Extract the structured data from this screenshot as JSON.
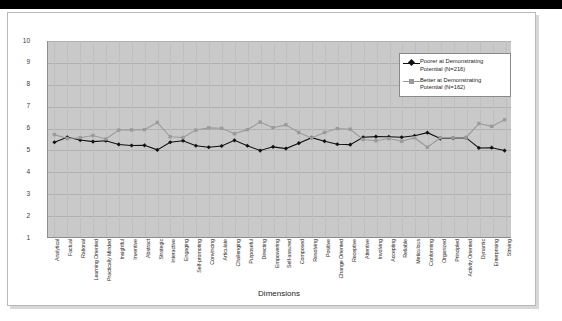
{
  "chart_data": {
    "type": "line",
    "title": "",
    "xlabel": "Dimensions",
    "ylabel": "",
    "ylim": [
      1,
      10
    ],
    "yticks": [
      1,
      2,
      3,
      4,
      5,
      6,
      7,
      8,
      9,
      10
    ],
    "grid": true,
    "legend_position": "top-right",
    "categories": [
      "Analytical",
      "Factual",
      "Rational",
      "Learning Oriented",
      "Practically Minded",
      "Insightful",
      "Inventive",
      "Abstract",
      "Strategic",
      "Interactive",
      "Engaging",
      "Self-promoting",
      "Convincing",
      "Articulate",
      "Challenging",
      "Purposeful",
      "Directing",
      "Empowering",
      "Self-assured",
      "Composed",
      "Resolving",
      "Positive",
      "Change Oriented",
      "Receptive",
      "Attentive",
      "Involving",
      "Accepting",
      "Reliable",
      "Meticulous",
      "Conforming",
      "Organized",
      "Principled",
      "Activity Oriented",
      "Dynamic",
      "Enterprising",
      "Striving"
    ],
    "series": [
      {
        "name": "Poorer at Demonstrating Potential (N=216)",
        "n": 216,
        "color": "#111111",
        "marker": "diamond",
        "values": [
          5.35,
          5.58,
          5.45,
          5.38,
          5.42,
          5.25,
          5.2,
          5.21,
          5.0,
          5.35,
          5.42,
          5.19,
          5.12,
          5.18,
          5.44,
          5.19,
          4.97,
          5.14,
          5.06,
          5.31,
          5.56,
          5.4,
          5.26,
          5.24,
          5.58,
          5.61,
          5.6,
          5.58,
          5.65,
          5.79,
          5.52,
          5.54,
          5.56,
          5.09,
          5.1,
          4.97
        ]
      },
      {
        "name": "Better at Demonstrating Potential (N=162)",
        "n": 162,
        "color": "#9a9a9a",
        "marker": "square",
        "values": [
          5.7,
          5.52,
          5.56,
          5.66,
          5.5,
          5.91,
          5.92,
          5.93,
          6.26,
          5.6,
          5.57,
          5.91,
          6.01,
          5.99,
          5.74,
          5.93,
          6.28,
          6.02,
          6.15,
          5.8,
          5.55,
          5.8,
          5.98,
          5.95,
          5.48,
          5.42,
          5.52,
          5.4,
          5.56,
          5.12,
          5.56,
          5.55,
          5.56,
          6.21,
          6.08,
          6.38
        ]
      }
    ]
  },
  "legend": {
    "items": [
      {
        "label_line1": "Poorer at Demonstrating",
        "label_line2": "Potential (N=216)"
      },
      {
        "label_line1": "Better at Demonstrating",
        "label_line2": "Potential (N=162)"
      }
    ]
  },
  "colors": {
    "plot_background": "#c9c9c9",
    "page_background": "#ffffff",
    "series_poorer": "#111111",
    "series_better": "#9a9a9a",
    "gridline": "#b0b0b0",
    "axis": "#8d8d8d",
    "topbar": "#000000"
  }
}
